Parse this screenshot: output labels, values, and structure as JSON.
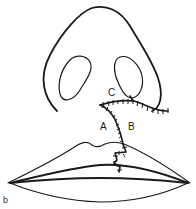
{
  "figure": {
    "panel_label": "b",
    "labels": {
      "a": "A",
      "b": "B",
      "c": "C"
    },
    "colors": {
      "line": "#1a1a1a",
      "background": "#ffffff"
    }
  }
}
